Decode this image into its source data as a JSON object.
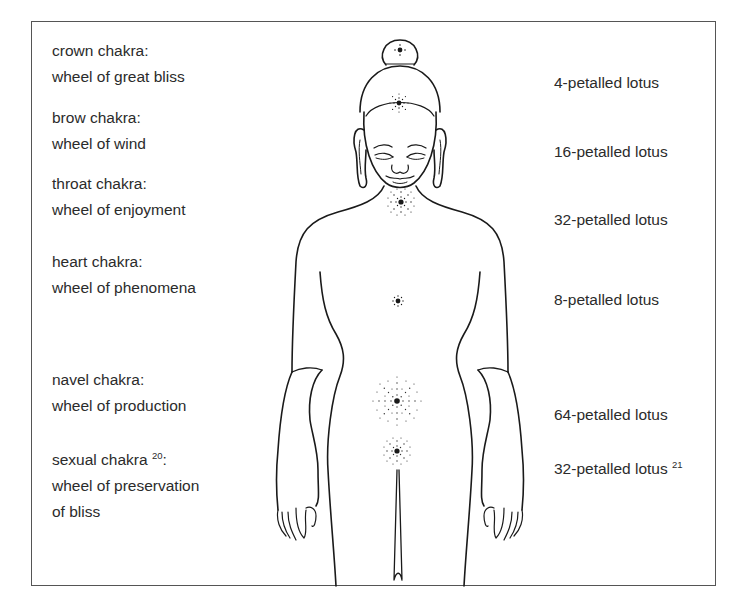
{
  "diagram": {
    "type": "chakra-body-diagram",
    "chakras": [
      {
        "name": "crown chakra:",
        "wheel": "wheel of great bliss",
        "lotus": "4-petalled lotus",
        "name_sup": "",
        "lotus_sup": ""
      },
      {
        "name": "brow chakra:",
        "wheel": "wheel of wind",
        "lotus": "16-petalled lotus",
        "name_sup": "",
        "lotus_sup": ""
      },
      {
        "name": "throat chakra:",
        "wheel": "wheel of enjoyment",
        "lotus": "32-petalled lotus",
        "name_sup": "",
        "lotus_sup": ""
      },
      {
        "name": "heart chakra:",
        "wheel": "wheel of phenomena",
        "lotus": "8-petalled lotus",
        "name_sup": "",
        "lotus_sup": ""
      },
      {
        "name": "navel chakra:",
        "wheel": "wheel of production",
        "lotus": "64-petalled lotus",
        "name_sup": "",
        "lotus_sup": ""
      },
      {
        "name": "sexual chakra",
        "name_sup": "20",
        "name_suffix": ":",
        "wheel": "wheel of preservation",
        "wheel_line2": "of bliss",
        "lotus": "32-petalled lotus",
        "lotus_sup": "21"
      }
    ],
    "colors": {
      "line": "#1a1a1a",
      "text": "#2b2b2b",
      "frame": "#555555",
      "background": "#ffffff"
    }
  }
}
